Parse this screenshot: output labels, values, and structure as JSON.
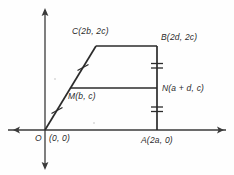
{
  "figure": {
    "axes": {
      "x_axis_name": "x-axis",
      "y_axis_name": "y-axis",
      "arrows": [
        "left",
        "right",
        "up",
        "down"
      ]
    },
    "stroke_color": "#3a3a3a",
    "background_color": "#fefefe",
    "labels": {
      "C": "C(2b, 2c)",
      "B": "B(2d, 2c)",
      "N": "N(a + d, c)",
      "M": "M(b, c)",
      "O": "O",
      "O_coord": "(0, 0)",
      "A": "A(2a, 0)"
    },
    "points": {
      "O": {
        "label": "O",
        "coords": "(0, 0)",
        "px": [
          45,
          130
        ]
      },
      "A": {
        "label": "A",
        "coords": "(2a, 0)",
        "px": [
          157,
          130
        ]
      },
      "B": {
        "label": "B",
        "coords": "(2d, 2c)",
        "px": [
          157,
          46
        ]
      },
      "C": {
        "label": "C",
        "coords": "(2b, 2c)",
        "px": [
          96,
          46
        ]
      },
      "M": {
        "label": "M",
        "coords": "(b, c)",
        "px": [
          70,
          88
        ]
      },
      "N": {
        "label": "N",
        "coords": "(a + d, c)",
        "px": [
          157,
          88
        ]
      }
    },
    "segments": [
      {
        "name": "OC",
        "from": "O",
        "to": "C",
        "ticks": 0
      },
      {
        "name": "CB",
        "from": "C",
        "to": "B",
        "ticks": 0
      },
      {
        "name": "BA",
        "from": "B",
        "to": "A",
        "ticks": 0
      },
      {
        "name": "OA",
        "from": "O",
        "to": "A",
        "ticks": 0
      },
      {
        "name": "MN",
        "from": "M",
        "to": "N",
        "ticks": 0
      }
    ],
    "tick_marks": [
      {
        "name": "tick-OM",
        "on": "OC",
        "count": 1
      },
      {
        "name": "tick-MC",
        "on": "OC",
        "count": 1
      },
      {
        "name": "tick-AN",
        "on": "BA",
        "count": 2
      },
      {
        "name": "tick-NB",
        "on": "BA",
        "count": 2
      }
    ]
  }
}
